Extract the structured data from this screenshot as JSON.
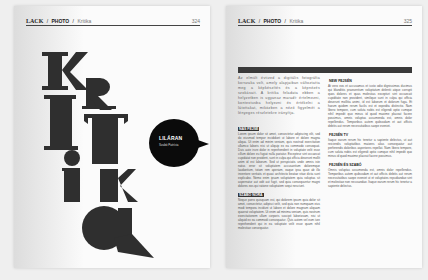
{
  "left_page": {
    "header": {
      "brand": "LACK",
      "section": "PHOTO",
      "subsection": "Kritika",
      "separator": "/",
      "page_number": "324"
    },
    "title_letters": [
      "K",
      "R",
      "I",
      "T",
      "I",
      "K",
      "A"
    ],
    "bubble": {
      "title": "LILÁRAN",
      "subtitle": "Szabó Patrícia"
    }
  },
  "right_page": {
    "header": {
      "brand": "LACK",
      "section": "PHOTO",
      "subsection": "Kritika",
      "separator": "/",
      "page_number": "325"
    },
    "intro": "Az elmúlt évtized a digitális fotográfia korszaka volt, amely alapjaiban változtatta meg a képkészítés és a képnézés szokásait. A kritika feladata ebben a helyzetben is ugyanaz maradt: értelmezni, kontextusba helyezni és értékelni a látottakat, miközben a néző figyelmét a lényeges részletekre irányítja.",
    "sections_left": [
      {
        "heading": "NAS FEJSÉ",
        "body": "Lorem ipsum dolor sit amet, consectetur adipiscing elit, sed do eiusmod tempor incididunt ut labore et dolore magna aliqua. Ut enim ad minim veniam, quis nostrud exercitation ullamco laboris nisi ut aliquip ex ea commodo consequat. Duis aute irure dolor in reprehenderit in voluptate velit esse cillum dolore eu fugiat nulla pariatur. Excepteur sint occaecat cupidatat non proident, sunt in culpa qui officia deserunt mollit anim id est laborum. Sed ut perspiciatis unde omnis iste natus error sit voluptatem accusantium doloremque laudantium, totam rem aperiam, eaque ipsa quae ab illo inventore veritatis et quasi architecto beatae vitae dicta sunt explicabo. Nemo enim ipsam voluptatem quia voluptas sit aspernatur aut odit aut fugit, sed quia consequuntur magni dolores eos qui ratione voluptatem sequi nesciunt."
      },
      {
        "heading": "SZABÓ NÓRA",
        "body": "Neque porro quisquam est, qui dolorem ipsum quia dolor sit amet, consectetur, adipisci velit, sed quia non numquam eius modi tempora incidunt ut labore et dolore magnam aliquam quaerat voluptatem. Ut enim ad minima veniam, quis nostrum exercitationem ullam corporis suscipit laboriosam, nisi ut aliquid ex ea commodi consequatur. Quis autem vel eum iure reprehenderit qui in ea voluptate velit esse quam nihil molestiae consequatur."
      }
    ],
    "sections_right": [
      {
        "heading": "NEW FEJSÉN",
        "body": "At vero eos et accusamus et iusto odio dignissimos ducimus qui blanditiis praesentium voluptatum deleniti atque corrupti quos dolores et quas molestias excepturi sint occaecati cupiditate non provident, similique sunt in culpa qui officia deserunt mollitia animi, id est laborum et dolorum fuga. Et harum quidem rerum facilis est et expedita distinctio. Nam libero tempore, cum soluta nobis est eligendi optio cumque nihil impedit quo minus id quod maxime placeat facere possimus, omnis voluptas assumenda est, omnis dolor repellendus. Temporibus autem quibusdam et aut officiis debitis aut rerum necessitatibus saepe eveniet."
      },
      {
        "heading": "FEJSÉN TV",
        "body": "Itaque earum rerum hic tenetur a sapiente delectus, ut aut reiciendis voluptatibus maiores alias consequatur aut perferendis doloribus asperiores repellat. Nam libero tempore, cum soluta nobis est eligendi optio cumque nihil impedit quo minus id quod maxime placeat facere possimus."
      },
      {
        "heading": "FEJSÉN ÉS SZABÓ",
        "body": "Omnis voluptas assumenda est, omnis dolor repellendus. Temporibus autem quibusdam et aut officiis debitis aut rerum necessitatibus saepe eveniet ut et voluptates repudiandae sint et molestiae non recusandae. Itaque earum rerum hic tenetur a sapiente delectus."
      }
    ]
  },
  "colors": {
    "background": "#efefef",
    "page": "#fbfbfb",
    "ink": "#2f2f2f",
    "bubble": "#0b0b0b",
    "bar": "#3a3a3a"
  }
}
